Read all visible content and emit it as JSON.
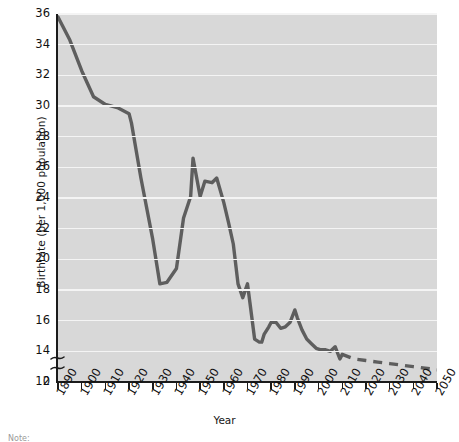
{
  "chart_data": {
    "type": "line",
    "title": "",
    "xlabel": "Year",
    "ylabel": "Birthrate (per 1,000 population)",
    "xlim": [
      1890,
      2050
    ],
    "ylim": [
      12,
      36
    ],
    "ytick_values": [
      12,
      14,
      16,
      18,
      20,
      22,
      24,
      26,
      28,
      30,
      32,
      34,
      36
    ],
    "ytick_labels": [
      "12",
      "14",
      "16",
      "18",
      "20",
      "22",
      "24",
      "26",
      "28",
      "30",
      "32",
      "34",
      "36"
    ],
    "y_zero_label": "0",
    "y_axis_break": true,
    "xtick_values": [
      1890,
      1900,
      1910,
      1920,
      1930,
      1940,
      1950,
      1960,
      1970,
      1980,
      1990,
      2000,
      2010,
      2020,
      2030,
      2040,
      2050
    ],
    "xtick_labels": [
      "1890",
      "1900",
      "1910",
      "1920",
      "1930",
      "1940",
      "1950",
      "1960",
      "1970",
      "1980",
      "1990",
      "2000",
      "2010",
      "2020",
      "2030",
      "2040",
      "2050"
    ],
    "grid": true,
    "grid_color": "#f4f4f4",
    "plot_background": "#d8d8d8",
    "line_color": "#5e5e5e",
    "legend": [],
    "series": [
      {
        "name": "Birthrate (actual)",
        "style": "solid",
        "x": [
          1890,
          1895,
          1900,
          1905,
          1910,
          1915,
          1920,
          1921,
          1925,
          1930,
          1933,
          1936,
          1940,
          1943,
          1946,
          1947,
          1950,
          1952,
          1955,
          1957,
          1960,
          1962,
          1964,
          1966,
          1968,
          1970,
          1971,
          1973,
          1975,
          1976,
          1977,
          1979,
          1980,
          1982,
          1984,
          1986,
          1988,
          1990,
          1991,
          1993,
          1995,
          1997,
          1999,
          2001,
          2003,
          2005,
          2007,
          2009,
          2010
        ],
        "y": [
          35.8,
          34.3,
          32.3,
          30.6,
          30.1,
          29.9,
          29.5,
          28.9,
          25.3,
          21.3,
          18.4,
          18.5,
          19.4,
          22.7,
          24.1,
          26.6,
          24.1,
          25.1,
          25.0,
          25.3,
          23.7,
          22.4,
          21.0,
          18.4,
          17.5,
          18.4,
          17.2,
          14.8,
          14.6,
          14.6,
          15.1,
          15.6,
          15.9,
          15.9,
          15.5,
          15.6,
          15.9,
          16.7,
          16.2,
          15.4,
          14.8,
          14.5,
          14.2,
          14.1,
          14.1,
          14.0,
          14.3,
          13.5,
          13.8
        ],
        "note": "solid historical line 1890-2010"
      },
      {
        "name": "Birthrate (projected)",
        "style": "dashed",
        "x": [
          2010,
          2015,
          2020,
          2025,
          2030,
          2035,
          2040,
          2045,
          2050
        ],
        "y": [
          13.8,
          13.5,
          13.4,
          13.3,
          13.2,
          13.1,
          13.0,
          12.9,
          12.8
        ],
        "note": "dashed projection 2010-2050"
      }
    ]
  },
  "axis": {
    "y_title": "Birthrate (per 1,000 population)",
    "x_title": "Year"
  },
  "footnote": "Note:"
}
